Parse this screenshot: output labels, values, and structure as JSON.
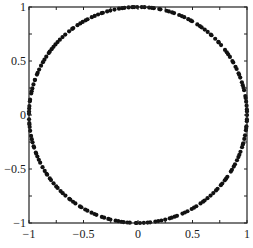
{
  "chart_data": {
    "type": "scatter",
    "title": "",
    "xlabel": "",
    "ylabel": "",
    "xlim": [
      -1,
      1
    ],
    "ylim": [
      -1,
      1
    ],
    "grid": false,
    "legend": null,
    "x_ticks": [
      -1,
      -0.5,
      0,
      0.5,
      1
    ],
    "y_ticks": [
      -1,
      -0.5,
      0,
      0.5,
      1
    ],
    "x_tick_labels": [
      "-1",
      "-0.5",
      "0",
      "0.5",
      "1"
    ],
    "y_tick_labels": [
      "-1",
      "-0.5",
      "0",
      "0.5",
      "1"
    ],
    "series": [
      {
        "name": "unit circle samples",
        "marker": "dot",
        "color": "#111111",
        "radius": 1,
        "num_points": 200
      }
    ]
  },
  "colors": {
    "marker": "#111111",
    "axis": "#222222",
    "background": "#ffffff"
  }
}
